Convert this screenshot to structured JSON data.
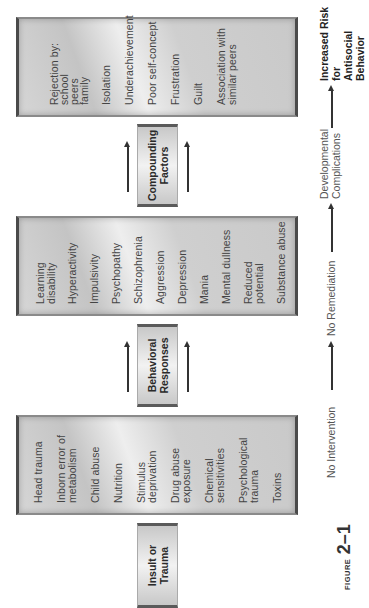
{
  "figure": {
    "label_word": "FIGURE",
    "label_number": "2–1"
  },
  "stages": [
    {
      "title": "Insult or\nTrauma",
      "items": [
        "Head trauma",
        "Inborn error of\nmetabolism",
        "Child abuse",
        "Nutrition",
        "Stimulus\ndeprivation",
        "Drug abuse\nexposure",
        "Chemical\nsensitivities",
        "Psychological\ntrauma",
        "Toxins"
      ]
    },
    {
      "title": "Behavioral\nResponses",
      "items": [
        "Learning\ndisability",
        "Hyperactivity",
        "Impulsivity",
        "Psychopathy",
        "Schizophrenia",
        "Aggression",
        "Depression",
        "Mania",
        "Mental dullness",
        "Reduced potential",
        "Substance abuse"
      ]
    },
    {
      "title": "Compounding\nFactors",
      "items": [
        "Rejection by:\n  school\n  peers\n  family",
        "Isolation",
        "Underachievement",
        "Poor self-concept",
        "Frustration",
        "Guilt",
        "Association with\nsimilar peers"
      ]
    }
  ],
  "flow": {
    "steps": [
      "No Intervention",
      "No Remediation",
      "Developmental\nComplications",
      "Increased Risk for\nAntisocial Behavior"
    ]
  },
  "colors": {
    "box_border": "#4a4a4a",
    "box_fill": "#d0d0d0",
    "text": "#444444",
    "arrow": "#333333"
  }
}
